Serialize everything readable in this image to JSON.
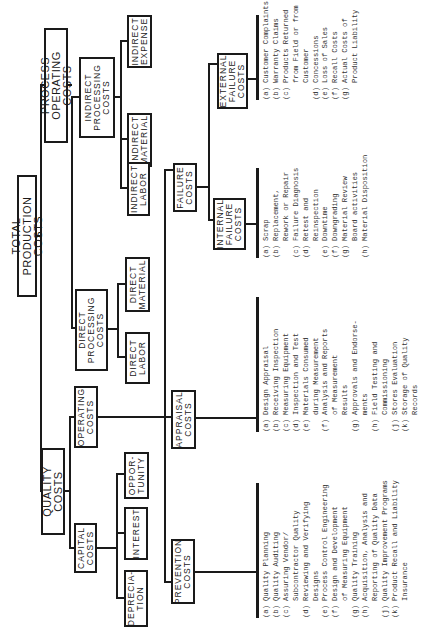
{
  "diagram": {
    "root": "TOTAL PRODUCTION COSTS",
    "nodes": {
      "process_operating": "PROCESS OPERATING\nCOSTS",
      "quality": "QUALITY COSTS",
      "indirect_processing": "INDIRECT\nPROCESSING\nCOSTS",
      "direct_processing": "DIRECT\nPROCESSING\nCOSTS",
      "operating": "OPERATING\nCOSTS",
      "capital": "CAPITAL\nCOSTS",
      "indirect_expense": "INDIRECT\nEXPENSE",
      "indirect_material": "INDIRECT\nMATERIAL",
      "indirect_labor": "INDIRECT\nLABOR",
      "direct_material": "DIRECT\nMATERIAL",
      "direct_labor": "DIRECT\nLABOR",
      "opportunity": "OPPOR-\nTUNITY",
      "interest": "INTEREST",
      "depreciation": "DEPRECIA-\nTION",
      "failure": "FAILURE\nCOSTS",
      "appraisal": "APPRAISAL\nCOSTS",
      "prevention": "PREVENTION\nCOSTS",
      "external_failure": "EXTERNAL\nFAILURE\nCOSTS",
      "internal_failure": "INTERNAL\nFAILURE\nCOSTS"
    },
    "lists": {
      "prevention": [
        {
          "k": "(a)",
          "t": "Quality Planning"
        },
        {
          "k": "(b)",
          "t": "Quality Auditing"
        },
        {
          "k": "(c)",
          "t": "Assuring Vendor/\nSubcontractor Quality"
        },
        {
          "k": "(d)",
          "t": "Reviewing and Verifying\nDesigns"
        },
        {
          "k": "(e)",
          "t": "Process Control Engineering"
        },
        {
          "k": "(f)",
          "t": "Design and Development\nof Measuring Equipment"
        },
        {
          "k": "(g)",
          "t": "Quality Training"
        },
        {
          "k": "(h)",
          "t": "Acquisition, Analysis and\nReporting of Quality Data"
        },
        {
          "k": "(j)",
          "t": "Quality Improvement Programs"
        },
        {
          "k": "(k)",
          "t": "Product Recall and Liability\nInsurance"
        }
      ],
      "appraisal": [
        {
          "k": "(a)",
          "t": "Design Appraisal"
        },
        {
          "k": "(b)",
          "t": "Receiving Inspection"
        },
        {
          "k": "(c)",
          "t": "Measuring Equipment"
        },
        {
          "k": "(d)",
          "t": "Inspection and Test"
        },
        {
          "k": "(e)",
          "t": "Materials Consumed\nduring Measurement"
        },
        {
          "k": "(f)",
          "t": "Analysis and Reports\nof Measurement\nResults"
        },
        {
          "k": "(g)",
          "t": "Approvals and Endorse-\nments"
        },
        {
          "k": "(h)",
          "t": "Field Testing and\nCommissioning"
        },
        {
          "k": "(j)",
          "t": "Stores Evaluation"
        },
        {
          "k": "(k)",
          "t": "Storage of Quality\nRecords"
        }
      ],
      "internal_failure": [
        {
          "k": "(a)",
          "t": "Scrap"
        },
        {
          "k": "(b)",
          "t": "Replacement,\nRework or Repair"
        },
        {
          "k": "(c)",
          "t": "Failure Diagnosis"
        },
        {
          "k": "(d)",
          "t": "Retest and\nReinspection"
        },
        {
          "k": "(e)",
          "t": "Downtime"
        },
        {
          "k": "(f)",
          "t": "Downgrading"
        },
        {
          "k": "(g)",
          "t": "Material Review\nBoard activities"
        },
        {
          "k": "(h)",
          "t": "Material Disposition"
        }
      ],
      "external_failure": [
        {
          "k": "(a)",
          "t": "Customer Complaints"
        },
        {
          "k": "(b)",
          "t": "Warranty Claims"
        },
        {
          "k": "(c)",
          "t": "Products Returned\nfrom Field or from\nCustomer"
        },
        {
          "k": "(d)",
          "t": "Concessions"
        },
        {
          "k": "(e)",
          "t": "Loss of Sales"
        },
        {
          "k": "(f)",
          "t": "Recall Costs"
        },
        {
          "k": "(g)",
          "t": "Actual Costs of\nProduct Liability"
        }
      ]
    }
  }
}
